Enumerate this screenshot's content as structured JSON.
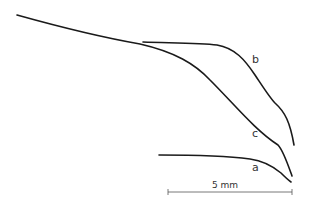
{
  "diagram": {
    "curves": [
      {
        "id": "a",
        "label": "a"
      },
      {
        "id": "b",
        "label": "b"
      },
      {
        "id": "c",
        "label": "c"
      }
    ],
    "scale_bar": {
      "label": "5 mm"
    }
  }
}
